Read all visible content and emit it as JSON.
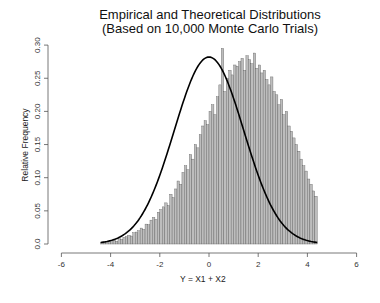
{
  "chart_data": {
    "type": "bar",
    "title": "Empirical and Theoretical Distributions",
    "subtitle": "(Based on 10,000 Monte Carlo Trials)",
    "xlabel": "Y = X1 + X2",
    "ylabel": "Relative Frequency",
    "xlim": [
      -6,
      6
    ],
    "ylim": [
      0,
      0.3
    ],
    "xticks": [
      "-6",
      "-4",
      "-2",
      "0",
      "2",
      "4",
      "6"
    ],
    "yticks": [
      "0.0",
      "0.05",
      "0.10",
      "0.15",
      "0.20",
      "0.25",
      "0.30"
    ],
    "grid": false,
    "bin_start": -4.4,
    "bin_width": 0.1,
    "values": [
      0.002,
      0.003,
      0.002,
      0.004,
      0.005,
      0.006,
      0.004,
      0.008,
      0.007,
      0.01,
      0.011,
      0.013,
      0.012,
      0.017,
      0.018,
      0.02,
      0.024,
      0.022,
      0.03,
      0.029,
      0.036,
      0.04,
      0.037,
      0.048,
      0.052,
      0.056,
      0.062,
      0.058,
      0.075,
      0.07,
      0.083,
      0.095,
      0.09,
      0.108,
      0.118,
      0.112,
      0.135,
      0.128,
      0.15,
      0.145,
      0.165,
      0.178,
      0.186,
      0.18,
      0.2,
      0.21,
      0.195,
      0.222,
      0.24,
      0.295,
      0.23,
      0.25,
      0.262,
      0.255,
      0.27,
      0.268,
      0.275,
      0.28,
      0.262,
      0.284,
      0.278,
      0.272,
      0.288,
      0.265,
      0.27,
      0.258,
      0.262,
      0.248,
      0.24,
      0.252,
      0.23,
      0.225,
      0.21,
      0.218,
      0.195,
      0.2,
      0.178,
      0.17,
      0.16,
      0.15,
      0.14,
      0.128,
      0.118,
      0.11,
      0.098,
      0.09,
      0.08,
      0.072
    ],
    "series": [
      {
        "name": "Empirical (histogram)",
        "type": "bar"
      },
      {
        "name": "Theoretical density N(0, 2)",
        "type": "line",
        "peak": 0.282,
        "range": [
          -4.4,
          4.4
        ]
      }
    ]
  }
}
